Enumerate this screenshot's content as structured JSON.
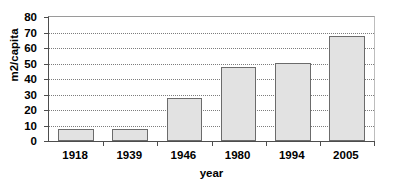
{
  "chart_data": {
    "type": "bar",
    "title": "",
    "categories": [
      "1918",
      "1939",
      "1946",
      "1980",
      "1994",
      "2005"
    ],
    "values": [
      7.5,
      7.5,
      28,
      48,
      50.5,
      68
    ],
    "xlabel": "year",
    "ylabel": "m2/capita",
    "ylim": [
      0,
      80
    ],
    "ytick_step": 10,
    "yticks": [
      "0",
      "10",
      "20",
      "30",
      "40",
      "50",
      "60",
      "70",
      "80"
    ],
    "grid": "horizontal-dotted",
    "legend": "none",
    "bar_fill_color": "#e2e2e2",
    "bar_border_color": "#6b6b6b",
    "gridline_color": "#7d7d7d",
    "axis_color": "#4d4d4d",
    "text_color": "#000000"
  }
}
